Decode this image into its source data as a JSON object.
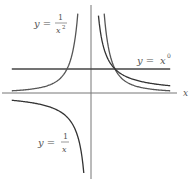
{
  "figure": {
    "axis_label_x": "x",
    "labels": {
      "inv_square": {
        "lhs": "y =",
        "num": "1",
        "den": "x",
        "exp": "2"
      },
      "inverse": {
        "lhs": "y =",
        "num": "1",
        "den": "x"
      },
      "constant": {
        "lhs": "y =",
        "base": "x",
        "exp": "0"
      }
    },
    "colors": {
      "axes": "#666666",
      "curves": "#444444",
      "labels": "#555555"
    }
  },
  "chart_data": {
    "type": "line",
    "title": "",
    "xlabel": "x",
    "ylabel": "",
    "xlim": [
      -3.7,
      3.5
    ],
    "ylim": [
      -3.6,
      3.8
    ],
    "grid": false,
    "series": [
      {
        "name": "y = 1/x^2",
        "domain": [
          [
            -3.3,
            -0.55
          ],
          [
            0.55,
            3.3
          ]
        ]
      },
      {
        "name": "y = 1/x",
        "domain": [
          [
            -3.3,
            -0.3
          ],
          [
            0.31,
            3.3
          ]
        ]
      },
      {
        "name": "y = x^0",
        "domain": [
          -3.3,
          3.3
        ],
        "value": 1
      }
    ],
    "annotations": [
      {
        "text": "y = 1/x^2",
        "position": "upper-left"
      },
      {
        "text": "y = x^0",
        "position": "right, above line y=1"
      },
      {
        "text": "y = 1/x",
        "position": "lower-left"
      },
      {
        "text": "x",
        "position": "right end of x-axis"
      }
    ]
  }
}
